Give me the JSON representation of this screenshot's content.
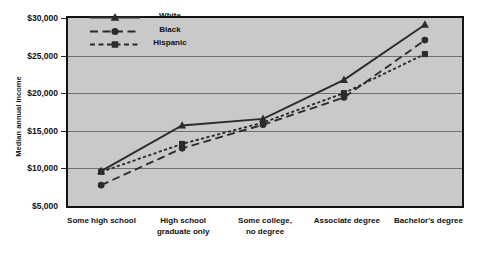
{
  "chart_data": {
    "type": "line",
    "title": "",
    "xlabel": "",
    "ylabel": "Median annual income",
    "ylim": [
      5000,
      30000
    ],
    "grid": true,
    "legend_position": "top-left-inside",
    "categories": [
      "Some high school",
      "High school\ngraduate only",
      "Some college,\nno degree",
      "Associate degree",
      "Bachelor's degree"
    ],
    "y_ticks": [
      5000,
      10000,
      15000,
      20000,
      25000,
      30000
    ],
    "y_tick_labels": [
      "$5,000",
      "$10,000",
      "$15,000",
      "$20,000",
      "$25,000",
      "$30,000"
    ],
    "series": [
      {
        "name": "White",
        "marker": "triangle",
        "line_style": "solid",
        "color": "#2b2b2b",
        "values": [
          9200,
          15400,
          16300,
          21600,
          29100
        ]
      },
      {
        "name": "Black",
        "marker": "circle",
        "line_style": "dashed-long",
        "color": "#2b2b2b",
        "values": [
          7300,
          12300,
          15500,
          19200,
          27000
        ]
      },
      {
        "name": "Hispanic",
        "marker": "square",
        "line_style": "dotted",
        "color": "#2b2b2b",
        "values": [
          9100,
          12900,
          15800,
          19800,
          25100
        ]
      }
    ]
  },
  "axis": {
    "y_title": "Median annual income",
    "y_labels": [
      "$30,000",
      "$25,000",
      "$20,000",
      "$15,000",
      "$10,000",
      "$5,000"
    ],
    "x_labels": [
      [
        "Some high school"
      ],
      [
        "High school",
        "graduate only"
      ],
      [
        "Some college,",
        "no degree"
      ],
      [
        "Associate degree"
      ],
      [
        "Bachelor's degree"
      ]
    ]
  },
  "legend": {
    "entries": [
      {
        "label": "White"
      },
      {
        "label": "Black"
      },
      {
        "label": "Hispanic"
      }
    ]
  },
  "colors": {
    "plot_background": "#c9c9c9",
    "plot_border": "#141414",
    "gridline": "#6f6f6f",
    "series_ink": "#2b2b2b",
    "text": "#111111",
    "page_background": "#ffffff"
  }
}
